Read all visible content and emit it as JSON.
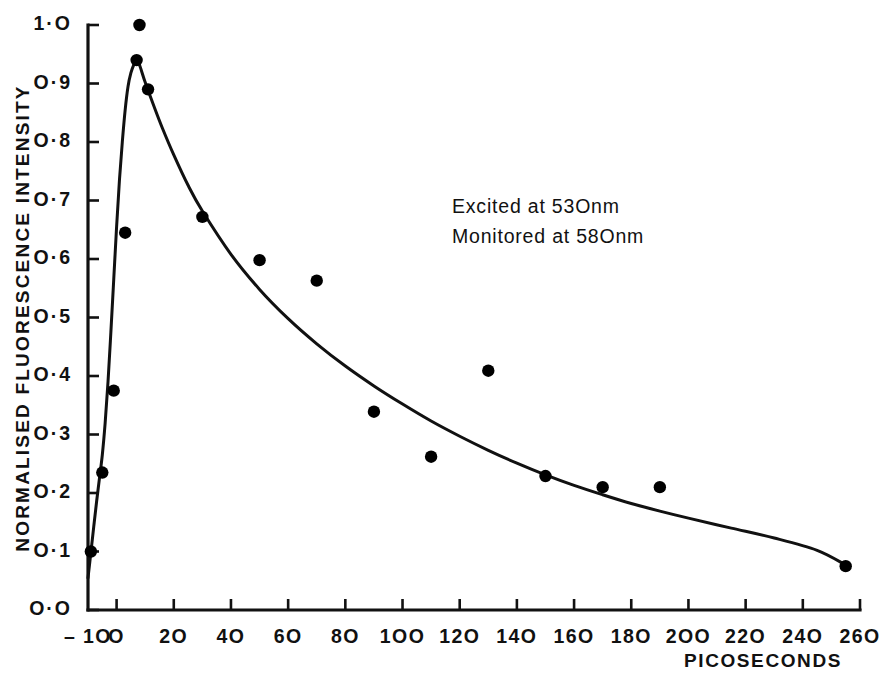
{
  "chart_data": {
    "type": "scatter",
    "title": "",
    "subtitle": "",
    "xlabel": "PICOSECONDS",
    "ylabel": "NORMALISED FLUORESCENCE INTENSITY",
    "xlim": [
      -10,
      260
    ],
    "ylim": [
      0.0,
      1.0
    ],
    "grid": false,
    "legend": null,
    "x_ticks": [
      -10,
      0,
      20,
      40,
      60,
      80,
      100,
      120,
      140,
      160,
      180,
      200,
      220,
      240,
      260
    ],
    "x_tick_labels": [
      "-10",
      "0",
      "20",
      "40",
      "60",
      "80",
      "100",
      "120",
      "140",
      "160",
      "180",
      "200",
      "220",
      "240",
      "260"
    ],
    "y_ticks": [
      0.0,
      0.1,
      0.2,
      0.3,
      0.4,
      0.5,
      0.6,
      0.7,
      0.8,
      0.9,
      1.0
    ],
    "y_tick_labels": [
      "0.0",
      "0.1",
      "0.2",
      "0.3",
      "0.4",
      "0.5",
      "0.6",
      "0.7",
      "0.8",
      "0.9",
      "1.0"
    ],
    "series": [
      {
        "name": "measured-points",
        "marker": "filled-circle",
        "color": "#000000",
        "x": [
          -9,
          -5,
          -1,
          3,
          7,
          8,
          11,
          30,
          50,
          70,
          90,
          110,
          130,
          150,
          170,
          190,
          255
        ],
        "y": [
          0.1,
          0.235,
          0.375,
          0.645,
          0.94,
          1.0,
          0.89,
          0.672,
          0.598,
          0.563,
          0.339,
          0.262,
          0.409,
          0.229,
          0.21,
          0.21,
          0.075
        ]
      },
      {
        "name": "fitted-decay-curve",
        "marker": "none",
        "color": "#111111",
        "x": [
          -10,
          -9,
          -8,
          -7,
          -6,
          -5,
          -4,
          -3,
          -2,
          -1,
          0,
          1,
          2,
          3,
          4,
          5,
          6,
          7,
          8,
          10,
          13,
          16,
          20,
          25,
          30,
          40,
          50,
          60,
          70,
          80,
          90,
          100,
          110,
          120,
          130,
          140,
          150,
          160,
          170,
          180,
          190,
          200,
          215,
          230,
          245,
          255
        ],
        "y": [
          0.055,
          0.098,
          0.142,
          0.185,
          0.225,
          0.265,
          0.32,
          0.39,
          0.475,
          0.565,
          0.655,
          0.735,
          0.8,
          0.855,
          0.895,
          0.918,
          0.932,
          0.94,
          0.932,
          0.902,
          0.862,
          0.824,
          0.778,
          0.726,
          0.682,
          0.608,
          0.548,
          0.498,
          0.455,
          0.417,
          0.383,
          0.352,
          0.323,
          0.297,
          0.273,
          0.251,
          0.231,
          0.213,
          0.197,
          0.182,
          0.169,
          0.157,
          0.14,
          0.123,
          0.102,
          0.077
        ]
      }
    ],
    "annotations": [
      {
        "text": "Excited at 53Onm",
        "x": 92,
        "y": 0.715
      },
      {
        "text": "Monitored at 58Onm",
        "x": 92,
        "y": 0.642
      }
    ]
  },
  "axis": {
    "x_title": "PICOSECONDS",
    "y_title": "NORMALISED FLUORESCENCE INTENSITY"
  },
  "annotations": {
    "excitation": "Excited at 53Onm",
    "monitoring": "Monitored at 58Onm"
  },
  "colors": {
    "ink": "#111111",
    "marker": "#000000",
    "background": "#ffffff"
  }
}
